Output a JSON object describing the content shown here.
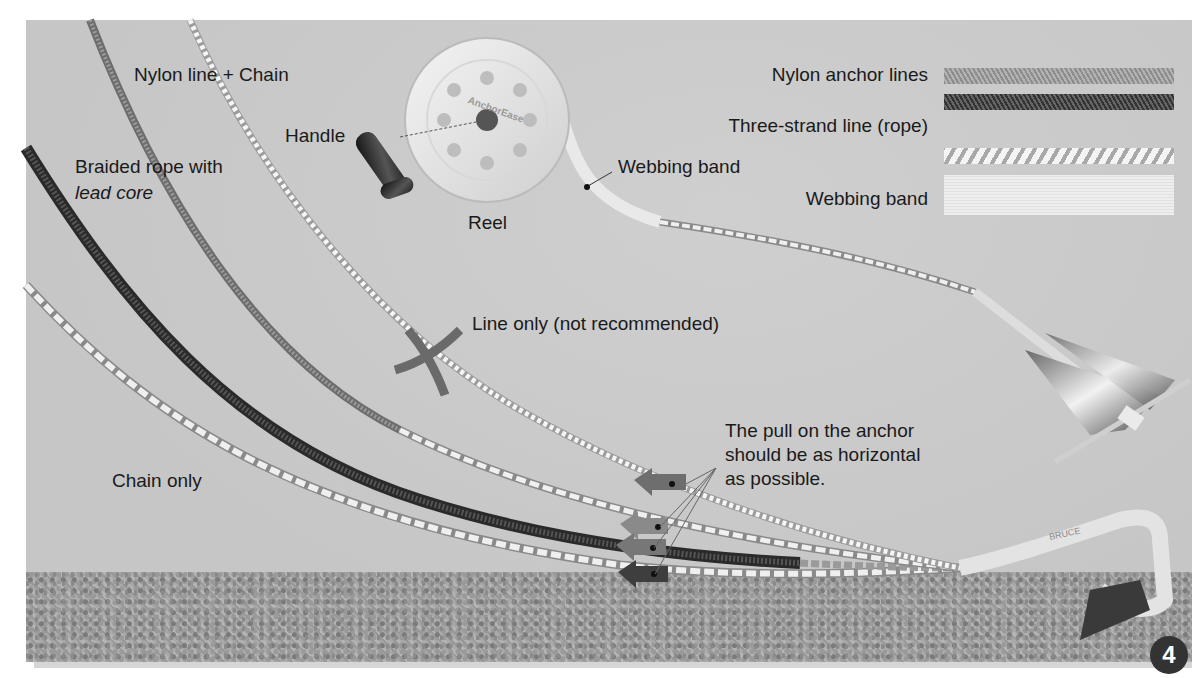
{
  "diagram": {
    "labels": {
      "nylon_line_chain": "Nylon line + Chain",
      "handle": "Handle",
      "braided_rope_line1": "Braided rope with",
      "braided_rope_line2": "lead core",
      "reel": "Reel",
      "webbing_band_pointer": "Webbing band",
      "line_only": "Line only (not recommended)",
      "pull_note_line1": "The pull on the anchor",
      "pull_note_line2": "should be as horizontal",
      "pull_note_line3": "as possible.",
      "chain_only": "Chain only",
      "reel_brand": "AnchorEase",
      "anchor_brand": "BRUCE"
    },
    "legend": {
      "items": [
        {
          "label": "Nylon anchor lines",
          "swatch": "braided-light"
        },
        {
          "label": "",
          "swatch": "braided-dark"
        },
        {
          "label": "Three-strand line (rope)",
          "swatch": "three-strand"
        },
        {
          "label": "Webbing band",
          "swatch": "webbing"
        }
      ]
    },
    "page_number": "4",
    "colors": {
      "background": "#c9c9c9",
      "seabed": "#a3a3a3",
      "text": "#1a1a1a",
      "arrow": "#6e6e6e",
      "x_mark": "#6a6a6a"
    }
  }
}
